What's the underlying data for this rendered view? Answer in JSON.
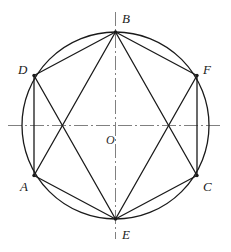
{
  "figure": {
    "type": "geometry-diagram",
    "background_color": "#ffffff",
    "stroke_color": "#1a1a1a",
    "axis_color": "#808080",
    "circle": {
      "name": "circumscribed-circle",
      "cx": 115.5,
      "cy": 125.5,
      "r": 93.5,
      "stroke_width": 1.3
    },
    "center": {
      "label": "O",
      "x": 115.5,
      "y": 125.5,
      "label_x": 106,
      "label_y": 134
    },
    "axes": [
      {
        "name": "horizontal-centerline",
        "x1": 8,
        "y1": 125.5,
        "x2": 223,
        "y2": 125.5,
        "style": "dash-dot"
      },
      {
        "name": "vertical-centerline",
        "x1": 115.5,
        "y1": 12,
        "x2": 115.5,
        "y2": 239,
        "style": "dash-dot"
      }
    ],
    "vertices": [
      {
        "label": "A",
        "x": 34.0,
        "y": 175.5,
        "label_x": 20,
        "label_y": 180
      },
      {
        "label": "B",
        "x": 115.5,
        "y": 32.0,
        "label_x": 122,
        "label_y": 12
      },
      {
        "label": "C",
        "x": 197.0,
        "y": 175.5,
        "label_x": 203,
        "label_y": 180
      },
      {
        "label": "D",
        "x": 34.0,
        "y": 75.5,
        "label_x": 18,
        "label_y": 63
      },
      {
        "label": "E",
        "x": 115.5,
        "y": 219.0,
        "label_x": 122,
        "label_y": 228
      },
      {
        "label": "F",
        "x": 197.0,
        "y": 75.5,
        "label_x": 203,
        "label_y": 63
      }
    ],
    "hexagon_edges": [
      {
        "name": "edge-D-B",
        "from": "D",
        "to": "B"
      },
      {
        "name": "edge-B-F",
        "from": "B",
        "to": "F"
      },
      {
        "name": "edge-F-C",
        "from": "F",
        "to": "C"
      },
      {
        "name": "edge-C-E",
        "from": "C",
        "to": "E"
      },
      {
        "name": "edge-E-A",
        "from": "E",
        "to": "A"
      },
      {
        "name": "edge-A-D",
        "from": "A",
        "to": "D"
      }
    ],
    "diagonals": [
      {
        "name": "diagonal-B-A",
        "from": "B",
        "to": "A"
      },
      {
        "name": "diagonal-B-C",
        "from": "B",
        "to": "C"
      },
      {
        "name": "diagonal-E-D",
        "from": "E",
        "to": "D"
      },
      {
        "name": "diagonal-E-F",
        "from": "E",
        "to": "F"
      }
    ],
    "vertex_dot_radius": 1.7
  }
}
